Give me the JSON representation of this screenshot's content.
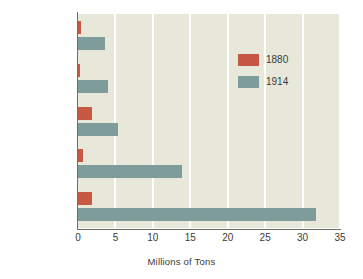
{
  "chart_data": {
    "type": "bar",
    "orientation": "horizontal",
    "title": "",
    "subtitle": "",
    "xlabel": "Millions of Tons",
    "ylabel": "",
    "xlim": [
      0,
      35
    ],
    "xticks": [
      0,
      5,
      10,
      15,
      20,
      25,
      30,
      35
    ],
    "xtick_labels": [
      "0",
      "5",
      "10",
      "15",
      "20",
      "25",
      "30",
      "35"
    ],
    "grid": true,
    "grid_axis": "x",
    "legend_position": "upper right",
    "categories": [
      "France",
      "Russia",
      "Great Britain",
      "Germany",
      "United States"
    ],
    "series": [
      {
        "name": "1880",
        "color": "#c75844",
        "values": [
          0.4,
          0.3,
          1.9,
          0.7,
          1.9
        ]
      },
      {
        "name": "1914",
        "color": "#7d9c9b",
        "values": [
          3.6,
          4.0,
          5.3,
          13.9,
          31.8
        ]
      }
    ]
  },
  "legend": {
    "entries": [
      {
        "label": "1880",
        "color": "#c75844"
      },
      {
        "label": "1914",
        "color": "#7d9c9b"
      }
    ]
  },
  "axis": {
    "x_title": "Millions of Tons",
    "tick_labels": [
      "0",
      "5",
      "10",
      "15",
      "20",
      "25",
      "30",
      "35"
    ]
  },
  "categories": [
    "France",
    "Russia",
    "Great Britain",
    "Germany",
    "United States"
  ],
  "colors": {
    "series_1880": "#c75844",
    "series_1914": "#7d9c9b",
    "plot_background": "#e7e8da",
    "page_background": "#ffffff",
    "gridline": "#ffffff",
    "axis_line": "#6f6f68",
    "text": "#3a3a38"
  }
}
